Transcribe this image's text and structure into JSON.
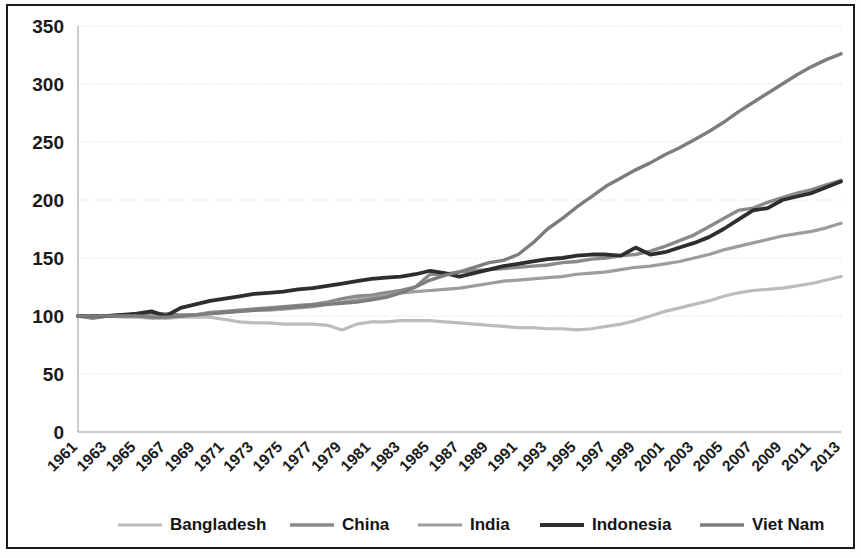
{
  "figure": {
    "background": "#ffffff",
    "border_color": "#1c1c1c"
  },
  "chart_data": {
    "type": "line",
    "title": "",
    "subtitle": "",
    "xlabel": "",
    "ylabel": "",
    "xlim": [
      1961,
      2013
    ],
    "ylim": [
      0,
      350
    ],
    "yticks": [
      0,
      50,
      100,
      150,
      200,
      250,
      300,
      350
    ],
    "ytick_labels": [
      "0",
      "50",
      "100",
      "150",
      "200",
      "250",
      "300",
      "350"
    ],
    "xticks": [
      1961,
      1963,
      1965,
      1967,
      1969,
      1971,
      1973,
      1975,
      1977,
      1979,
      1981,
      1983,
      1985,
      1987,
      1989,
      1991,
      1993,
      1995,
      1997,
      1999,
      2001,
      2003,
      2005,
      2007,
      2009,
      2011,
      2013
    ],
    "xtick_labels": [
      "1961",
      "1963",
      "1965",
      "1967",
      "1969",
      "1971",
      "1973",
      "1975",
      "1977",
      "1979",
      "1981",
      "1983",
      "1985",
      "1987",
      "1989",
      "1991",
      "1993",
      "1995",
      "1997",
      "1999",
      "2001",
      "2003",
      "2005",
      "2007",
      "2009",
      "2011",
      "2013"
    ],
    "xtick_rotation": -45,
    "grid": true,
    "grid_axis": "y",
    "grid_color": "#c8c8c8",
    "legend_position": "bottom",
    "x": [
      1961,
      1962,
      1963,
      1964,
      1965,
      1966,
      1967,
      1968,
      1969,
      1970,
      1971,
      1972,
      1973,
      1974,
      1975,
      1976,
      1977,
      1978,
      1979,
      1980,
      1981,
      1982,
      1983,
      1984,
      1985,
      1986,
      1987,
      1988,
      1989,
      1990,
      1991,
      1992,
      1993,
      1994,
      1995,
      1996,
      1997,
      1998,
      1999,
      2000,
      2001,
      2002,
      2003,
      2004,
      2005,
      2006,
      2007,
      2008,
      2009,
      2010,
      2011,
      2012,
      2013
    ],
    "series": [
      {
        "name": "Bangladesh",
        "color": "#bcbcbc",
        "width": 3.2,
        "values": [
          100,
          100,
          100,
          99,
          99,
          98,
          98,
          99,
          99,
          99,
          97,
          95,
          94,
          94,
          93,
          93,
          93,
          92,
          88,
          93,
          95,
          95,
          96,
          96,
          96,
          95,
          94,
          93,
          92,
          91,
          90,
          90,
          89,
          89,
          88,
          89,
          91,
          93,
          96,
          100,
          104,
          107,
          110,
          113,
          117,
          120,
          122,
          123,
          124,
          126,
          128,
          131,
          134
        ]
      },
      {
        "name": "China",
        "color": "#8a8a8a",
        "width": 3.4,
        "values": [
          100,
          98,
          100,
          101,
          101,
          102,
          102,
          101,
          101,
          103,
          104,
          105,
          106,
          107,
          108,
          109,
          110,
          112,
          115,
          117,
          118,
          120,
          122,
          125,
          136,
          136,
          138,
          139,
          140,
          141,
          142,
          143,
          144,
          146,
          147,
          149,
          150,
          152,
          153,
          156,
          160,
          165,
          170,
          177,
          184,
          191,
          193,
          198,
          202,
          206,
          209,
          213,
          217
        ]
      },
      {
        "name": "India",
        "color": "#9d9d9d",
        "width": 3.2,
        "values": [
          100,
          100,
          100,
          100,
          100,
          99,
          99,
          100,
          101,
          102,
          103,
          104,
          105,
          105,
          106,
          107,
          108,
          110,
          112,
          114,
          116,
          118,
          120,
          121,
          122,
          123,
          124,
          126,
          128,
          130,
          131,
          132,
          133,
          134,
          136,
          137,
          138,
          140,
          142,
          143,
          145,
          147,
          150,
          153,
          157,
          160,
          163,
          166,
          169,
          171,
          173,
          176,
          180
        ]
      },
      {
        "name": "Indonesia",
        "color": "#2e2e2e",
        "width": 3.8,
        "values": [
          100,
          100,
          100,
          101,
          102,
          104,
          100,
          107,
          110,
          113,
          115,
          117,
          119,
          120,
          121,
          123,
          124,
          126,
          128,
          130,
          132,
          133,
          134,
          136,
          139,
          137,
          134,
          137,
          140,
          143,
          145,
          147,
          149,
          150,
          152,
          153,
          153,
          152,
          159,
          153,
          155,
          159,
          163,
          168,
          175,
          183,
          191,
          193,
          200,
          203,
          206,
          211,
          216
        ]
      },
      {
        "name": "Viet Nam",
        "color": "#7d7d7d",
        "width": 3.4,
        "values": [
          100,
          100,
          100,
          100,
          100,
          99,
          99,
          100,
          101,
          102,
          103,
          104,
          105,
          106,
          107,
          108,
          109,
          110,
          111,
          112,
          114,
          116,
          120,
          125,
          131,
          135,
          138,
          142,
          146,
          148,
          153,
          163,
          175,
          184,
          194,
          203,
          212,
          219,
          226,
          232,
          239,
          245,
          252,
          259,
          267,
          276,
          284,
          292,
          300,
          308,
          315,
          321,
          326
        ]
      }
    ]
  },
  "legend": {
    "items": [
      {
        "label": "Bangladesh",
        "color": "#bcbcbc"
      },
      {
        "label": "China",
        "color": "#8a8a8a"
      },
      {
        "label": "India",
        "color": "#9d9d9d"
      },
      {
        "label": "Indonesia",
        "color": "#2e2e2e"
      },
      {
        "label": "Viet Nam",
        "color": "#7d7d7d"
      }
    ]
  }
}
